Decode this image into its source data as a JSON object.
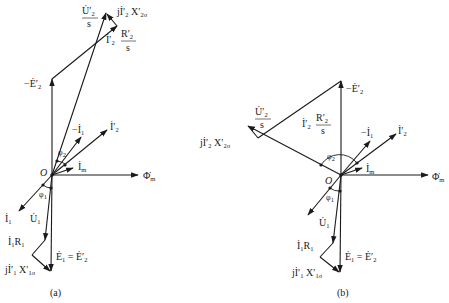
{
  "figure": {
    "panels": [
      {
        "id": "a",
        "caption": "(a)",
        "origin_label": "O",
        "labels": {
          "u2s_num": "U̇′",
          "u2s_sub": "2",
          "u2s_den": "s",
          "jx2_pre": "jİ′",
          "jx2_sub1": "2",
          "jx2_x": " X′",
          "jx2_sub2": "2σ",
          "r2_pre": "İ′",
          "r2_sub1": "2",
          "r2_num": "R′",
          "r2_sub2": "2",
          "r2_den": "s",
          "negE2": "−Ė′",
          "negE2_sub": "2",
          "negI1": "−İ",
          "negI1_sub": "1",
          "I2": "İ′",
          "I2_sub": "2",
          "phi2": "φ",
          "phi2_sub": "2",
          "Im": "İ",
          "Im_sub": "m",
          "Phim": "Φ̇",
          "Phim_sub": "m",
          "phi1": "φ",
          "phi1_sub": "1",
          "I1": "İ",
          "I1_sub": "1",
          "U1": "U̇",
          "U1_sub": "1",
          "I1R1": "İ",
          "I1R1_sub1": "1",
          "I1R1_R": "R",
          "I1R1_sub2": "1",
          "E1": "Ė",
          "E1_sub": "1",
          "E1_eq": " = Ė′",
          "E1_eq_sub": "2",
          "jx1_pre": "jİ′",
          "jx1_sub1": "1",
          "jx1_x": " X′",
          "jx1_sub2": "1σ"
        }
      },
      {
        "id": "b",
        "caption": "(b)",
        "origin_label": "O",
        "labels": {
          "u2s_num": "U̇′",
          "u2s_sub": "2",
          "u2s_den": "s",
          "jx2_pre": "jİ′",
          "jx2_sub1": "2",
          "jx2_x": " X′",
          "jx2_sub2": "2σ",
          "r2_pre": "İ′",
          "r2_sub1": "2",
          "r2_num": "R′",
          "r2_sub2": "2",
          "r2_den": "s",
          "negE2": "−Ė′",
          "negE2_sub": "2",
          "negI1": "−İ",
          "negI1_sub": "1",
          "I2": "İ′",
          "I2_sub": "2",
          "phi2": "φ",
          "phi2_sub": "2",
          "Im": "İ",
          "Im_sub": "m",
          "Phim": "Φ̇",
          "Phim_sub": "m",
          "phi1": "φ",
          "phi1_sub": "1",
          "U1": "U̇",
          "U1_sub": "1",
          "I1R1": "İ",
          "I1R1_sub1": "1",
          "I1R1_R": "R",
          "I1R1_sub2": "1",
          "E1": "Ė",
          "E1_sub": "1",
          "E1_eq": " = Ė′",
          "E1_eq_sub": "2",
          "jx1_pre": "jİ′",
          "jx1_sub1": "1",
          "jx1_x": " X′",
          "jx1_sub2": "1σ"
        }
      }
    ]
  }
}
